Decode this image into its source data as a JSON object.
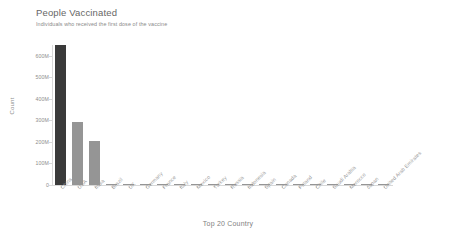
{
  "chart_data": {
    "type": "bar",
    "title": "People Vaccinated",
    "subtitle": "Individuals who received the first dose of the vaccine",
    "xlabel": "Top 20 Country",
    "ylabel": "Count",
    "ylim": [
      0,
      650000000
    ],
    "grid": false,
    "legend": null,
    "y_ticks": [
      {
        "value": 0,
        "label": "0"
      },
      {
        "value": 100000000,
        "label": "100M"
      },
      {
        "value": 200000000,
        "label": "200M"
      },
      {
        "value": 300000000,
        "label": "300M"
      },
      {
        "value": 400000000,
        "label": "400M"
      },
      {
        "value": 500000000,
        "label": "500M"
      },
      {
        "value": 600000000,
        "label": "600M"
      }
    ],
    "categories": [
      "China",
      "USA",
      "India",
      "Brazil",
      "UK",
      "Germany",
      "France",
      "Italy",
      "Mexico",
      "Turkey",
      "Russia",
      "Indonesia",
      "Spain",
      "Canada",
      "Poland",
      "Chile",
      "Saudi Arabia",
      "Morocco",
      "Japan",
      "United Arab Emirates"
    ],
    "values": [
      648000000,
      293000000,
      205000000,
      3500000,
      3000000,
      2600000,
      2400000,
      2200000,
      2000000,
      1900000,
      1800000,
      1700000,
      1600000,
      1500000,
      1400000,
      1300000,
      1200000,
      1100000,
      1000000,
      900000
    ],
    "bar_colors": [
      "#3a3a3a",
      "#959595",
      "#959595",
      "#959595",
      "#959595",
      "#959595",
      "#959595",
      "#959595",
      "#959595",
      "#959595",
      "#959595",
      "#959595",
      "#959595",
      "#959595",
      "#959595",
      "#959595",
      "#959595",
      "#959595",
      "#959595",
      "#959595"
    ],
    "highlight_index": 0,
    "accent_color": "#3a3a3a",
    "bar_color": "#959595",
    "axis_color": "#d8d8d8",
    "text_color": "#8d8d8d"
  }
}
